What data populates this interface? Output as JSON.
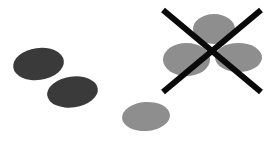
{
  "figure": {
    "canvas": {
      "width": 269,
      "height": 143,
      "background": "#ffffff"
    },
    "palette": {
      "dark_ellipse": "#3a3a3a",
      "gray_ellipse": "#8e8e8e",
      "gray_ellipse_overlap": "#7e7e7e",
      "cross_stroke": "#0a0a0a",
      "background": "#ffffff"
    },
    "shapes": [
      {
        "id": "dark-ellipse-upper-left",
        "kind": "ellipse",
        "group": "accepted-dark-pair",
        "fill": "#3a3a3a",
        "cx": 38.5,
        "cy": 64.0,
        "rx": 25.5,
        "ry": 16.0,
        "rotation": -8
      },
      {
        "id": "dark-ellipse-lower-left",
        "kind": "ellipse",
        "group": "accepted-dark-pair",
        "fill": "#3a3a3a",
        "cx": 72.5,
        "cy": 92.0,
        "rx": 25.5,
        "ry": 15.5,
        "rotation": -8
      },
      {
        "id": "gray-ellipse-bottom-center",
        "kind": "ellipse",
        "group": "accepted-gray-single",
        "fill": "#8e8e8e",
        "cx": 146.0,
        "cy": 116.5,
        "rx": 24.0,
        "ry": 14.5,
        "rotation": -4
      },
      {
        "id": "gray-ellipse-cluster-top",
        "kind": "ellipse",
        "group": "rejected-cluster",
        "fill": "#8e8e8e",
        "cx": 214.0,
        "cy": 29.0,
        "rx": 21.0,
        "ry": 15.0,
        "rotation": 0
      },
      {
        "id": "gray-ellipse-cluster-left",
        "kind": "ellipse",
        "group": "rejected-cluster",
        "fill": "#8e8e8e",
        "cx": 186.5,
        "cy": 59.5,
        "rx": 23.5,
        "ry": 16.5,
        "rotation": 0
      },
      {
        "id": "gray-ellipse-cluster-right",
        "kind": "ellipse",
        "group": "rejected-cluster",
        "fill": "#8e8e8e",
        "cx": 238.5,
        "cy": 57.5,
        "rx": 23.5,
        "ry": 14.5,
        "rotation": 0
      }
    ],
    "cross_mark": {
      "id": "rejection-cross",
      "label": "X",
      "meaning": "rejected",
      "stroke": "#0a0a0a",
      "stroke_width": 6,
      "strokes": [
        {
          "x1": 163,
          "y1": 10,
          "x2": 261,
          "y2": 92
        },
        {
          "x1": 261,
          "y1": 10,
          "x2": 163,
          "y2": 92
        }
      ]
    },
    "groups": [
      {
        "id": "accepted-dark-pair",
        "label": "",
        "member_count": 2,
        "marked_rejected": false
      },
      {
        "id": "accepted-gray-single",
        "label": "",
        "member_count": 1,
        "marked_rejected": false
      },
      {
        "id": "rejected-cluster",
        "label": "",
        "member_count": 3,
        "marked_rejected": true
      }
    ]
  }
}
